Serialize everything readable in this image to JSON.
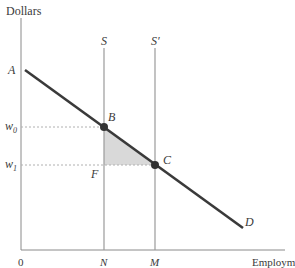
{
  "diagram": {
    "y_axis_label": "Dollars",
    "x_axis_label": "Employment",
    "origin_label": "0",
    "points": {
      "A": "A",
      "B": "B",
      "C": "C",
      "D": "D",
      "F": "F"
    },
    "supply_labels": {
      "S": "S",
      "S_prime": "S′"
    },
    "y_ticks": {
      "w0": "w",
      "w0_sub": "0",
      "w1": "w",
      "w1_sub": "1"
    },
    "x_ticks": {
      "N": "N",
      "M": "M"
    },
    "colors": {
      "axis": "#8a8a8a",
      "demand_line": "#3a3a3a",
      "supply_line": "#9a9a9a",
      "dashed": "#b0b0b0",
      "shaded_triangle": "#d9d9d9",
      "point": "#333333",
      "text": "#3a3a3a"
    }
  }
}
